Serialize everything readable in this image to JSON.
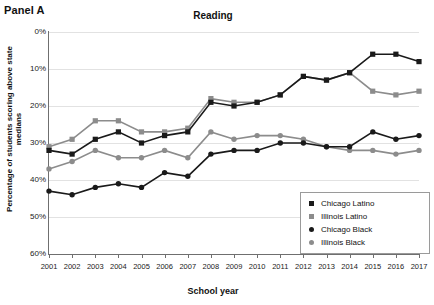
{
  "panel": {
    "label": "Panel A"
  },
  "axis": {
    "ylabel": "Percentage of students scoring above state medians",
    "xlabel": "School year",
    "yticks": [
      "60%",
      "50%",
      "40%",
      "30%",
      "20%",
      "10%",
      "0%"
    ]
  },
  "legend": {
    "items": [
      {
        "label": "Chicago Latino",
        "marker": "square",
        "color": "#1a1a1a"
      },
      {
        "label": "Illinois Latino",
        "marker": "square",
        "color": "#8c8c8c"
      },
      {
        "label": "Chicago Black",
        "marker": "circle",
        "color": "#1a1a1a"
      },
      {
        "label": "Illinois Black",
        "marker": "circle",
        "color": "#8c8c8c"
      }
    ]
  },
  "chart_data": {
    "type": "line",
    "title": "Reading",
    "xlabel": "School year",
    "ylabel": "Percentage of students scoring above state medians",
    "categories": [
      "2001",
      "2002",
      "2003",
      "2004",
      "2005",
      "2006",
      "2007",
      "2008",
      "2009",
      "2010",
      "2011",
      "2012",
      "2013",
      "2014",
      "2015",
      "2016",
      "2017"
    ],
    "x": [
      2001,
      2002,
      2003,
      2004,
      2005,
      2006,
      2007,
      2008,
      2009,
      2010,
      2011,
      2012,
      2013,
      2014,
      2015,
      2016,
      2017
    ],
    "ylim": [
      0,
      60
    ],
    "xlim": [
      2001,
      2017
    ],
    "ytick_values": [
      0,
      10,
      20,
      30,
      40,
      50,
      60
    ],
    "grid": true,
    "legend_position": "lower-right",
    "series": [
      {
        "name": "Chicago Latino",
        "marker": "square",
        "color": "#1a1a1a",
        "values": [
          28,
          27,
          31,
          33,
          30,
          32,
          33,
          41,
          40,
          41,
          43,
          48,
          47,
          49,
          54,
          54,
          52
        ]
      },
      {
        "name": "Illinois Latino",
        "marker": "square",
        "color": "#8c8c8c",
        "values": [
          29,
          31,
          36,
          36,
          33,
          33,
          34,
          42,
          41,
          41,
          43,
          48,
          47,
          49,
          44,
          43,
          44
        ]
      },
      {
        "name": "Chicago Black",
        "marker": "circle",
        "color": "#1a1a1a",
        "values": [
          17,
          16,
          18,
          19,
          18,
          22,
          21,
          27,
          28,
          28,
          30,
          30,
          29,
          29,
          33,
          31,
          32
        ]
      },
      {
        "name": "Illinois Black",
        "marker": "circle",
        "color": "#8c8c8c",
        "values": [
          23,
          25,
          28,
          26,
          26,
          28,
          26,
          33,
          31,
          32,
          32,
          31,
          29,
          28,
          28,
          27,
          28
        ]
      }
    ]
  }
}
